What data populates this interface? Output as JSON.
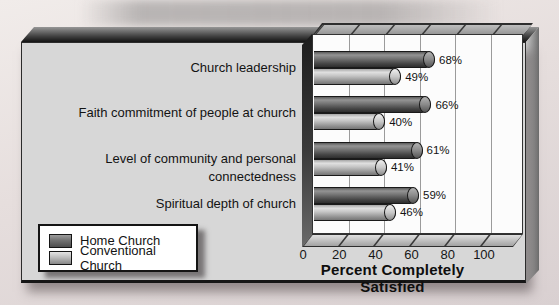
{
  "colors": {
    "home_bar": "#6e6e6e",
    "conventional_bar": "#b8b8b8",
    "panel": "#d7d7d7",
    "plot_background": "#fcfcfc",
    "gridline": "#9b9b9b",
    "background": "#e3dbda",
    "text": "#131313"
  },
  "legend": {
    "swatch_icons": [
      "home-church-swatch",
      "conventional-church-swatch"
    ]
  },
  "chart_data": {
    "type": "bar",
    "orientation": "horizontal",
    "title": "",
    "xlabel": "Percent Completely Satisfied",
    "ylabel": "",
    "categories": [
      "Church leadership",
      "Faith commitment of people at church",
      "Level of community and personal connectedness",
      "Spiritual depth of church"
    ],
    "series": [
      {
        "name": "Home Church",
        "values": [
          68,
          66,
          61,
          59
        ]
      },
      {
        "name": "Conventional Church",
        "values": [
          49,
          40,
          41,
          46
        ]
      }
    ],
    "value_suffix": "%",
    "xticks": [
      0,
      20,
      40,
      60,
      80,
      100
    ],
    "xlim": [
      0,
      118
    ],
    "grid": true,
    "legend_position": "bottom-left"
  }
}
